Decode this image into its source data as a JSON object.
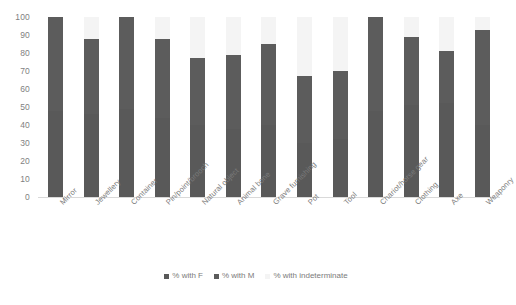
{
  "chart_data": {
    "type": "bar",
    "subtype": "stacked-bar",
    "title": "",
    "xlabel": "",
    "ylabel": "",
    "ylim": [
      0,
      100
    ],
    "yticks": [
      0,
      10,
      20,
      30,
      40,
      50,
      60,
      70,
      80,
      90,
      100
    ],
    "ytick_labels": [
      "0",
      "10",
      "20",
      "30",
      "40",
      "50",
      "60",
      "70",
      "80",
      "90",
      "100"
    ],
    "grid": false,
    "legend_position": "bottom-center",
    "categories": [
      "Mirror",
      "Jewellery",
      "Container",
      "Pin/point/brooch",
      "Natural object",
      "Animal bone",
      "Grave furnishing",
      "Pot",
      "Tool",
      "Chariot/horse gear",
      "Clothing",
      "Axe",
      "Weaponry"
    ],
    "series": [
      {
        "name": "% with F",
        "color": "#595959",
        "values": [
          48,
          46,
          49,
          44,
          40,
          38,
          40,
          30,
          32,
          48,
          51,
          52,
          40
        ]
      },
      {
        "name": "% with M",
        "color": "#5c5c5c",
        "values": [
          52,
          42,
          51,
          44,
          37,
          41,
          45,
          37,
          38,
          52,
          38,
          29,
          53
        ]
      },
      {
        "name": "% with indeterminate",
        "color": "#f4f4f4",
        "values": [
          0,
          12,
          0,
          12,
          23,
          21,
          15,
          33,
          30,
          0,
          11,
          19,
          7
        ]
      }
    ],
    "bar_totals": [
      100,
      88,
      100,
      88,
      77,
      79,
      85,
      67,
      70,
      100,
      89,
      81,
      93
    ]
  },
  "legend": {
    "items": [
      {
        "label": "% with F",
        "color": "#595959"
      },
      {
        "label": "% with M",
        "color": "#5c5c5c"
      },
      {
        "label": "% with indeterminate",
        "color": "#f4f4f4"
      }
    ]
  }
}
